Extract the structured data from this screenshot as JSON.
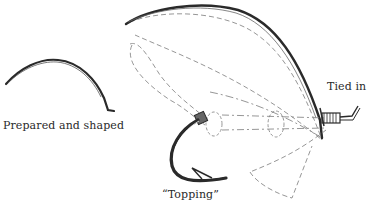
{
  "diagram": {
    "type": "illustration",
    "labels": {
      "prepared": "Prepared and shaped",
      "tied": "Tied in",
      "topping": "“Topping”"
    },
    "colors": {
      "ink": "#2a2a2a",
      "dashed": "#8a8a8a",
      "background": "#ffffff"
    }
  }
}
